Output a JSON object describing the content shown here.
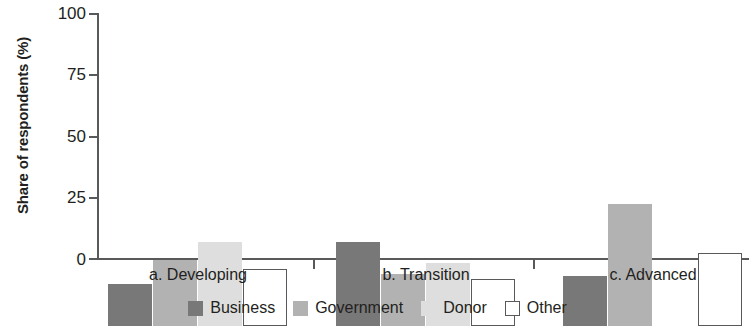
{
  "chart_data": {
    "type": "bar",
    "title": "",
    "subtitle": "",
    "xlabel": "",
    "ylabel": "Share of respondents (%)",
    "ylim": [
      0,
      100
    ],
    "yticks": [
      0,
      25,
      50,
      75,
      100
    ],
    "ytick_labels": [
      "0",
      "25",
      "50",
      "75",
      "100"
    ],
    "grid": false,
    "legend_position": "bottom-center",
    "categories": [
      "a. Developing",
      "b. Transition",
      "c. Advanced"
    ],
    "series": [
      {
        "name": "Business",
        "color": "#787878",
        "values": [
          17,
          34,
          20.5
        ]
      },
      {
        "name": "Government",
        "color": "#b2b2b2",
        "values": [
          27,
          21,
          49.5
        ]
      },
      {
        "name": "Donor",
        "color": "#dedede",
        "values": [
          34,
          25.5,
          0
        ]
      },
      {
        "name": "Other",
        "color": "#ffffff",
        "values": [
          23,
          19,
          29.5
        ]
      }
    ]
  },
  "axis": {
    "y_title": "Share of respondents (%)",
    "y_tick_0": "0",
    "y_tick_1": "25",
    "y_tick_2": "50",
    "y_tick_3": "75",
    "y_tick_4": "100"
  },
  "categories": {
    "c0": "a. Developing",
    "c1": "b. Transition",
    "c2": "c. Advanced"
  },
  "legend": {
    "items": [
      {
        "label": "Business"
      },
      {
        "label": "Government"
      },
      {
        "label": "Donor"
      },
      {
        "label": "Other"
      }
    ]
  }
}
